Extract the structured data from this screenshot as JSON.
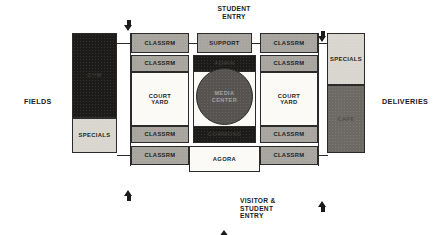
{
  "diagram": {
    "type": "architectural-bubble-plan"
  },
  "context_labels": {
    "left": "FIELDS",
    "right": "DELIVERIES"
  },
  "entries": {
    "top": "STUDENT\nENTRY",
    "bottom": "VISITOR &\nSTUDENT\nENTRY"
  },
  "arrows": {
    "top_left": "arrow-down-icon",
    "top_right": "arrow-down-icon",
    "bottom_left": "arrow-up-icon",
    "bottom_right": "arrow-up-icon",
    "bottom_center": "arrow-up-large-icon"
  },
  "blocks": {
    "left_dark": "GYM",
    "left_specials": "SPECIALS",
    "right_specials": "SPECIALS",
    "right_dark": "CAFE",
    "top_left_classrm": "CLASSRM",
    "top_support": "SUPPORT",
    "top_right_classrm": "CLASSRM",
    "row2_left_classrm": "CLASSRM",
    "row2_right_classrm": "CLASSRM",
    "left_courtyard": "COURT\nYARD",
    "right_courtyard": "COURT\nYARD",
    "row3_left_classrm": "CLASSRM",
    "row3_right_classrm": "CLASSRM",
    "bottom_left_classrm": "CLASSRM",
    "bottom_agora": "AGORA",
    "bottom_right_classrm": "CLASSRM",
    "center_top_band": "ADMIN",
    "media_center": "MEDIA\nCENTER",
    "center_bottom_band": "COMMONS"
  },
  "colors": {
    "mid_grey": "#a8a49e",
    "light_grey": "#d9d6cf",
    "white": "#fbfaf7",
    "dark": "#1d1b19",
    "mid_dark": "#6d6a64",
    "circle": "#565350",
    "stroke": "#2b2b2b",
    "text": "#1b1b1b"
  }
}
